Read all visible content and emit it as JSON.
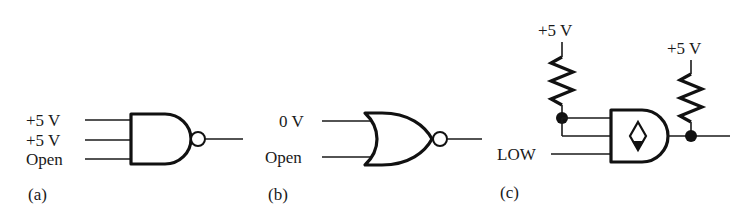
{
  "figure": {
    "background_color": "#ffffff",
    "ink_color": "#1a1a1a"
  },
  "panels": [
    {
      "id": "a",
      "caption": "(a)",
      "gate_type": "NAND",
      "inputs": [
        {
          "label": "+5 V"
        },
        {
          "label": "+5 V"
        },
        {
          "label": "Open"
        }
      ],
      "output": {
        "label": ""
      },
      "has_inversion_bubble": true
    },
    {
      "id": "b",
      "caption": "(b)",
      "gate_type": "NOR",
      "inputs": [
        {
          "label": "0 V"
        },
        {
          "label": "Open"
        }
      ],
      "output": {
        "label": ""
      },
      "has_inversion_bubble": true
    },
    {
      "id": "c",
      "caption": "(c)",
      "gate_type": "AND",
      "open_collector": true,
      "inputs": [
        {
          "label": ""
        },
        {
          "label": ""
        },
        {
          "label": "LOW"
        }
      ],
      "supplies": [
        {
          "label": "+5 V",
          "position": "left-pullup"
        },
        {
          "label": "+5 V",
          "position": "right-pullup"
        }
      ],
      "junctions": [
        {
          "name": "input-pullup-node"
        },
        {
          "name": "output-pullup-node"
        }
      ],
      "has_inversion_bubble": false
    }
  ]
}
